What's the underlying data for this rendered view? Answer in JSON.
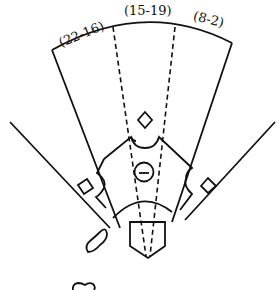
{
  "diagram": {
    "type": "baseball-field-spray-chart",
    "stroke_color": "#111111",
    "background": "#ffffff",
    "zones": [
      {
        "id": "left",
        "label": "(22-16)"
      },
      {
        "id": "center",
        "label": "(15-19)"
      },
      {
        "id": "right",
        "label": "(8-2)"
      }
    ],
    "markers": {
      "second_base": "diamond-icon",
      "pitcher": "minus-circle-icon",
      "home_plate": "home-plate-pentagon",
      "on_deck": [
        "on-deck-circle-blob-1",
        "on-deck-circle-blob-2"
      ]
    }
  }
}
